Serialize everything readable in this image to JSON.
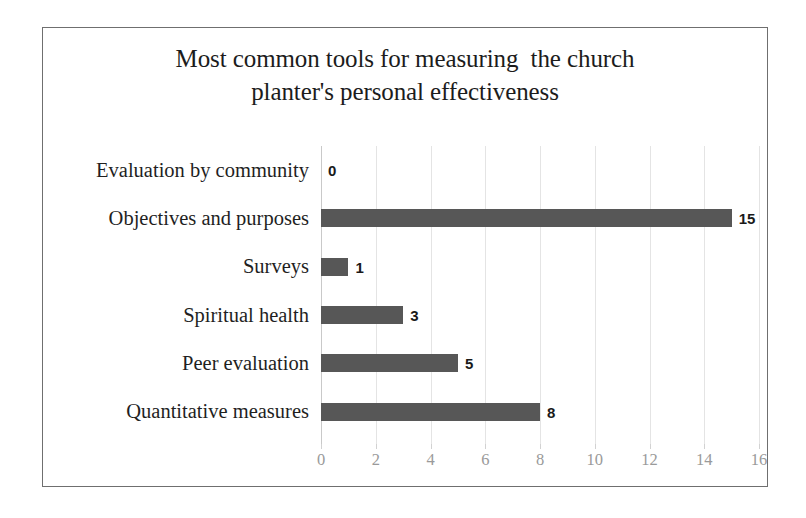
{
  "chart_data": {
    "type": "bar",
    "orientation": "horizontal",
    "title": "Most common tools for measuring the church planter's personal effectiveness",
    "title_lines": [
      "Most common tools for measuring  the church",
      "planter's personal effectiveness"
    ],
    "categories": [
      "Evaluation by community",
      "Objectives and purposes",
      "Surveys",
      "Spiritual health",
      "Peer evaluation",
      "Quantitative measures"
    ],
    "values": [
      0,
      15,
      1,
      3,
      5,
      8
    ],
    "value_labels": [
      "0",
      "15",
      "1",
      "3",
      "5",
      "8"
    ],
    "xlabel": "",
    "ylabel": "",
    "xlim": [
      0,
      16
    ],
    "xticks": [
      0,
      2,
      4,
      6,
      8,
      10,
      12,
      14,
      16
    ],
    "xtick_labels": [
      "0",
      "2",
      "4",
      "6",
      "8",
      "10",
      "12",
      "14",
      "16"
    ],
    "grid": "vertical",
    "legend": "none",
    "colors": {
      "bar": "#575757",
      "gridline": "#e4e4e4",
      "axis_line": "#c9c9c9",
      "tick_label": "#9a9a9a",
      "category_label": "#1f1f1f",
      "value_label": "#1a1a1a",
      "title": "#1c1c1c",
      "frame_border": "#6f6f6f",
      "background": "#ffffff"
    }
  }
}
